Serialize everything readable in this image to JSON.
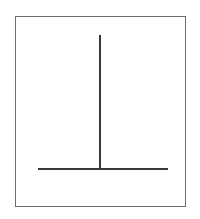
{
  "figure": {
    "shape": "inverted-t",
    "frame_color": "#6e6e6e",
    "line_color": "#3a3a3a",
    "vertical_line": {
      "x": 100,
      "y_top": 35,
      "y_bottom": 169
    },
    "horizontal_line": {
      "y": 169,
      "x_left": 38,
      "x_right": 168
    }
  },
  "caption": {
    "text": ""
  }
}
